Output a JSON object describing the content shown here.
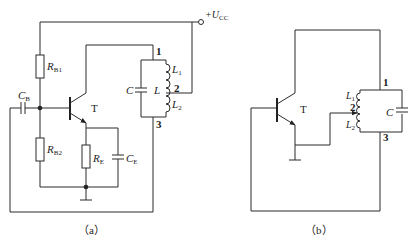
{
  "figure_a": {
    "caption": "（a）",
    "supply_label": "+U",
    "supply_sub": "CC",
    "transistor_label": "T",
    "components": {
      "RB1": {
        "main": "R",
        "sub": "B1"
      },
      "RB2": {
        "main": "R",
        "sub": "B2"
      },
      "RE": {
        "main": "R",
        "sub": "E"
      },
      "CB": {
        "main": "C",
        "sub": "B"
      },
      "CE": {
        "main": "C",
        "sub": "E"
      },
      "C": {
        "main": "C"
      },
      "L": {
        "main": "L"
      },
      "L1": {
        "main": "L",
        "sub": "1"
      },
      "L2": {
        "main": "L",
        "sub": "2"
      }
    },
    "nodes": [
      "1",
      "2",
      "3"
    ]
  },
  "figure_b": {
    "caption": "（b）",
    "transistor_label": "T",
    "components": {
      "C": {
        "main": "C"
      },
      "L1": {
        "main": "L",
        "sub": "1"
      },
      "L2": {
        "main": "L",
        "sub": "2"
      }
    },
    "nodes": [
      "1",
      "2",
      "3"
    ]
  }
}
